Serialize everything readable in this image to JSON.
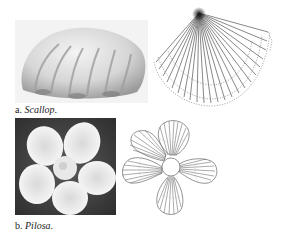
{
  "figure": {
    "panels": [
      {
        "id": "a",
        "caption_prefix": "a.",
        "caption_name": "Scallop",
        "caption_suffix": ".",
        "photo_subject": "scallop shell photograph",
        "diagram_subject": "fan of radial strokes with dotted arc boundaries"
      },
      {
        "id": "b",
        "caption_prefix": "b.",
        "caption_name": "Pilosa",
        "caption_suffix": ".",
        "photo_subject": "five-petal white flower photograph",
        "diagram_subject": "five-petal outline with radial hatching around center circle"
      }
    ]
  },
  "colors": {
    "line": "#555555",
    "dotted": "#8a8a8a",
    "photo_dark": "#3a3a3a",
    "shell_light": "#e4e4e4",
    "petal": "#f4f4f4"
  }
}
